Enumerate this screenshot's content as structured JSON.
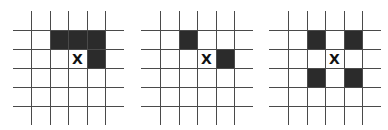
{
  "figure": {
    "center_label": "X",
    "colors": {
      "line": "#4a4a4a",
      "shaded": "#2b2b2b",
      "background": "#ffffff"
    },
    "grids": [
      {
        "id": "grid-1",
        "center": [
          2,
          2
        ],
        "shaded": [
          [
            1,
            1
          ],
          [
            2,
            1
          ],
          [
            3,
            1
          ],
          [
            3,
            2
          ]
        ]
      },
      {
        "id": "grid-2",
        "center": [
          2,
          2
        ],
        "shaded": [
          [
            1,
            1
          ],
          [
            3,
            2
          ]
        ]
      },
      {
        "id": "grid-3",
        "center": [
          2,
          2
        ],
        "shaded": [
          [
            1,
            1
          ],
          [
            3,
            1
          ],
          [
            1,
            3
          ],
          [
            3,
            3
          ]
        ]
      }
    ]
  }
}
